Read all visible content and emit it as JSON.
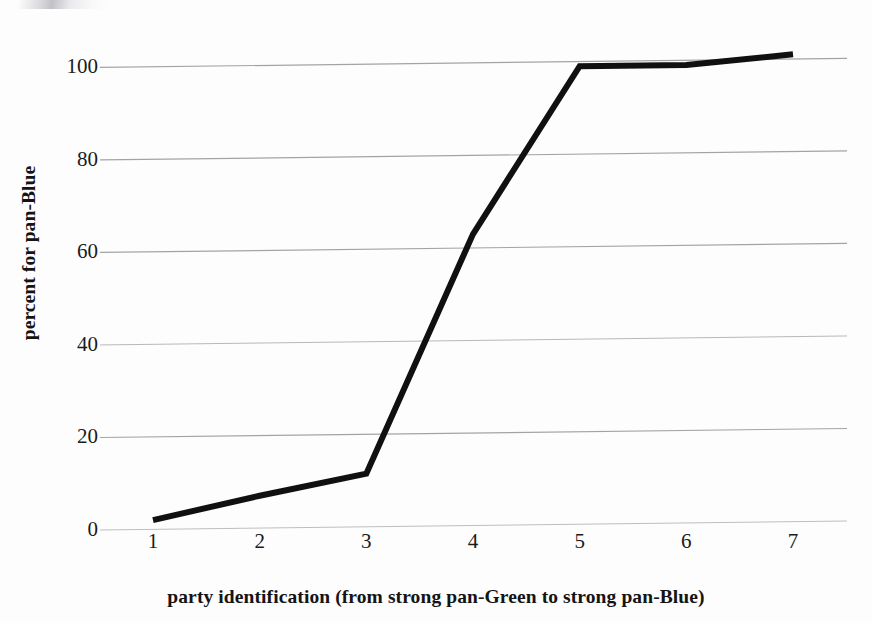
{
  "chart_data": {
    "type": "line",
    "title": "",
    "xlabel": "party identification (from strong pan-Green to strong pan-Blue)",
    "ylabel": "percent for pan-Blue",
    "categories": [
      "1",
      "2",
      "3",
      "4",
      "5",
      "6",
      "7"
    ],
    "x": [
      1,
      2,
      3,
      4,
      5,
      6,
      7
    ],
    "values": [
      2,
      7,
      11.5,
      63,
      99,
      99,
      101
    ],
    "series": [
      {
        "name": "percent for pan-Blue",
        "values": [
          2,
          7,
          11.5,
          63,
          99,
          99,
          101
        ]
      }
    ],
    "ylim": [
      0,
      107
    ],
    "xlim": [
      0.55,
      7.45
    ],
    "ytick_labels": [
      "0",
      "20",
      "40",
      "60",
      "80",
      "100"
    ],
    "ytick_values": [
      0,
      20,
      40,
      60,
      80,
      100
    ],
    "xtick_labels": [
      "1",
      "2",
      "3",
      "4",
      "5",
      "6",
      "7"
    ],
    "grid": "horizontal",
    "legend": "none",
    "line_color": "#101010",
    "grid_color": "#8b8b8b",
    "background_color": "#fdfdfd",
    "line_width": 6,
    "markers": "none"
  }
}
